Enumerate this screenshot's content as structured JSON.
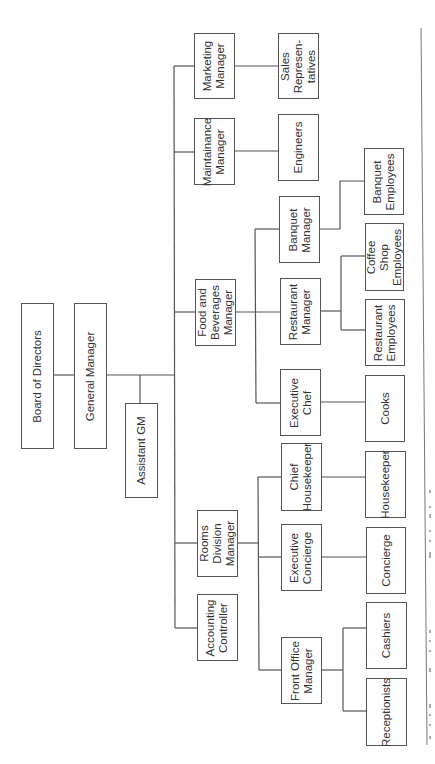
{
  "chart_title": "Hotel Organizational Chart",
  "nodes": {
    "board": "Board of Directors",
    "gm": "General Manager",
    "agm": "Assistant GM",
    "marketing": "Marketing\nManager",
    "sales": "Sales\nRepresen-\ntatives",
    "maintenance": "Maintainance\nManager",
    "engineers": "Engineers",
    "fnb": "Food and\nBeverages\nManager",
    "banquet_mgr": "Banquet\nManager",
    "banquet_emp": "Banquet\nEmployees",
    "restaurant_mgr": "Restaurant\nManager",
    "coffee_emp": "Coffee\nShop\nEmployees",
    "restaurant_emp": "Restaurant\nEmployees",
    "exec_chef": "Executive\nChef",
    "cooks": "Cooks",
    "rooms": "Rooms\nDivision\nManager",
    "chief_hk": "Chief\nHousekeeper",
    "housekeeper": "Housekeeper",
    "exec_concierge": "Executive\nConcierge",
    "concierge": "Concierge",
    "accounting": "Accounting\nController",
    "front_office": "Front Office\nManager",
    "cashiers": "Cashiers",
    "receptionists": "Receptionists"
  },
  "hierarchy": [
    {
      "name": "Board of Directors",
      "children": [
        {
          "name": "General Manager",
          "children": [
            {
              "name": "Assistant GM"
            },
            {
              "name": "Marketing Manager",
              "children": [
                {
                  "name": "Sales Representatives"
                }
              ]
            },
            {
              "name": "Maintainance Manager",
              "children": [
                {
                  "name": "Engineers"
                }
              ]
            },
            {
              "name": "Food and Beverages Manager",
              "children": [
                {
                  "name": "Banquet Manager",
                  "children": [
                    {
                      "name": "Banquet Employees"
                    }
                  ]
                },
                {
                  "name": "Restaurant Manager",
                  "children": [
                    {
                      "name": "Coffee Shop Employees"
                    },
                    {
                      "name": "Restaurant Employees"
                    }
                  ]
                },
                {
                  "name": "Executive Chef",
                  "children": [
                    {
                      "name": "Cooks"
                    }
                  ]
                }
              ]
            },
            {
              "name": "Rooms Division Manager",
              "children": [
                {
                  "name": "Chief Housekeeper",
                  "children": [
                    {
                      "name": "Housekeeper"
                    }
                  ]
                },
                {
                  "name": "Executive Concierge",
                  "children": [
                    {
                      "name": "Concierge"
                    }
                  ]
                },
                {
                  "name": "Front Office Manager",
                  "children": [
                    {
                      "name": "Cashiers"
                    },
                    {
                      "name": "Receptionists"
                    }
                  ]
                }
              ]
            },
            {
              "name": "Accounting Controller"
            }
          ]
        }
      ]
    }
  ],
  "colors": {
    "line": "#555555",
    "box_border": "#555555",
    "text": "#333333",
    "background": "#ffffff"
  }
}
